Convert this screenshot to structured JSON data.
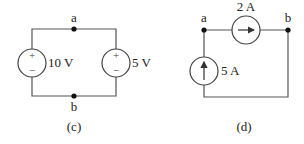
{
  "circuit_c": {
    "caption": "(c)",
    "node_top": "a",
    "node_bottom": "b",
    "left_source": {
      "type": "voltage",
      "value": "10 V",
      "plus": "+",
      "minus": "−"
    },
    "right_source": {
      "type": "voltage",
      "value": "5 V",
      "plus": "+",
      "minus": "−"
    }
  },
  "circuit_d": {
    "caption": "(d)",
    "node_left": "a",
    "node_right": "b",
    "top_source": {
      "type": "current",
      "value": "2 A",
      "direction": "right"
    },
    "left_source": {
      "type": "current",
      "value": "5 A",
      "direction": "up"
    }
  },
  "colors": {
    "wire": "#555555",
    "text": "#222222",
    "background": "#ffffff"
  }
}
